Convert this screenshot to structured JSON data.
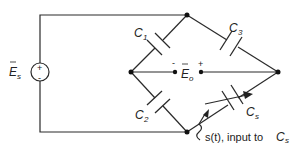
{
  "diagram": {
    "source": {
      "symbol": "E",
      "subscript": "s",
      "plus": "+",
      "minus": "-"
    },
    "output": {
      "symbol": "E",
      "subscript": "o",
      "plus": "+",
      "minus": "-"
    },
    "capacitors": [
      {
        "id": "C1",
        "symbol": "C",
        "subscript": "1"
      },
      {
        "id": "C2",
        "symbol": "C",
        "subscript": "2"
      },
      {
        "id": "C3",
        "symbol": "C",
        "subscript": "3"
      },
      {
        "id": "Cs",
        "symbol": "C",
        "subscript": "s",
        "variable": true
      }
    ],
    "annotation": {
      "text": "s(t), input to ",
      "symbol": "C",
      "subscript": "s"
    }
  }
}
